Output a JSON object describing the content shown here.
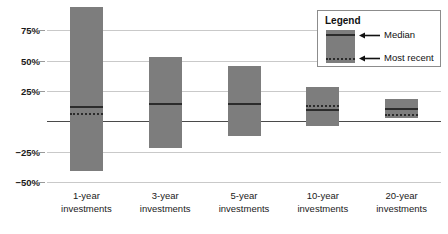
{
  "chart_data": {
    "type": "bar",
    "title": "",
    "subtitle": "",
    "xlabel": "",
    "ylabel": "",
    "grid": true,
    "ylim": [
      -50,
      100
    ],
    "y_ticks": [
      75,
      50,
      25,
      0,
      -25,
      -50
    ],
    "y_tick_labels": [
      "75%",
      "50%",
      "25%",
      "",
      "−25%",
      "−50%"
    ],
    "categories": [
      "1-year investments",
      "3-year investments",
      "5-year investments",
      "10-year investments",
      "20-year investments"
    ],
    "category_lines": [
      [
        "1-year",
        "investments"
      ],
      [
        "3-year",
        "investments"
      ],
      [
        "5-year",
        "investments"
      ],
      [
        "10-year",
        "investments"
      ],
      [
        "20-year",
        "investments"
      ]
    ],
    "series": [
      {
        "name": "Range high",
        "values": [
          94,
          53,
          46,
          28,
          18
        ]
      },
      {
        "name": "Range low",
        "values": [
          -41,
          -22,
          -12,
          -4,
          3
        ]
      },
      {
        "name": "Median",
        "values": [
          12,
          14,
          14,
          9,
          10
        ]
      },
      {
        "name": "Most recent",
        "values": [
          6,
          14,
          14,
          13,
          5
        ]
      }
    ],
    "legend": {
      "position": "top-right",
      "title": "Legend",
      "entries": [
        {
          "label": "Median",
          "style": "solid-line"
        },
        {
          "label": "Most recent",
          "style": "dotted-line"
        }
      ]
    },
    "colors": {
      "bar_fill": "#7d7d7d",
      "line": "#2b2b2b",
      "gridline": "#c9c9c9",
      "zero_line": "#4a4a4a",
      "text": "#1a1a1a",
      "background": "#ffffff"
    }
  }
}
